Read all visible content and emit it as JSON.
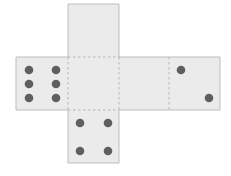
{
  "diagram": {
    "type": "die-net",
    "face_fill": "#ebebeb",
    "outline_color": "#bdbdbd",
    "fold_line_color": "#b5b5b5",
    "pip_color": "#5f5f5f",
    "faces": [
      {
        "position": "top",
        "pips": 0
      },
      {
        "position": "left",
        "pips": 6
      },
      {
        "position": "center",
        "pips": 0
      },
      {
        "position": "center-right",
        "pips": 0
      },
      {
        "position": "right",
        "pips": 2
      },
      {
        "position": "bottom",
        "pips": 4
      }
    ]
  }
}
